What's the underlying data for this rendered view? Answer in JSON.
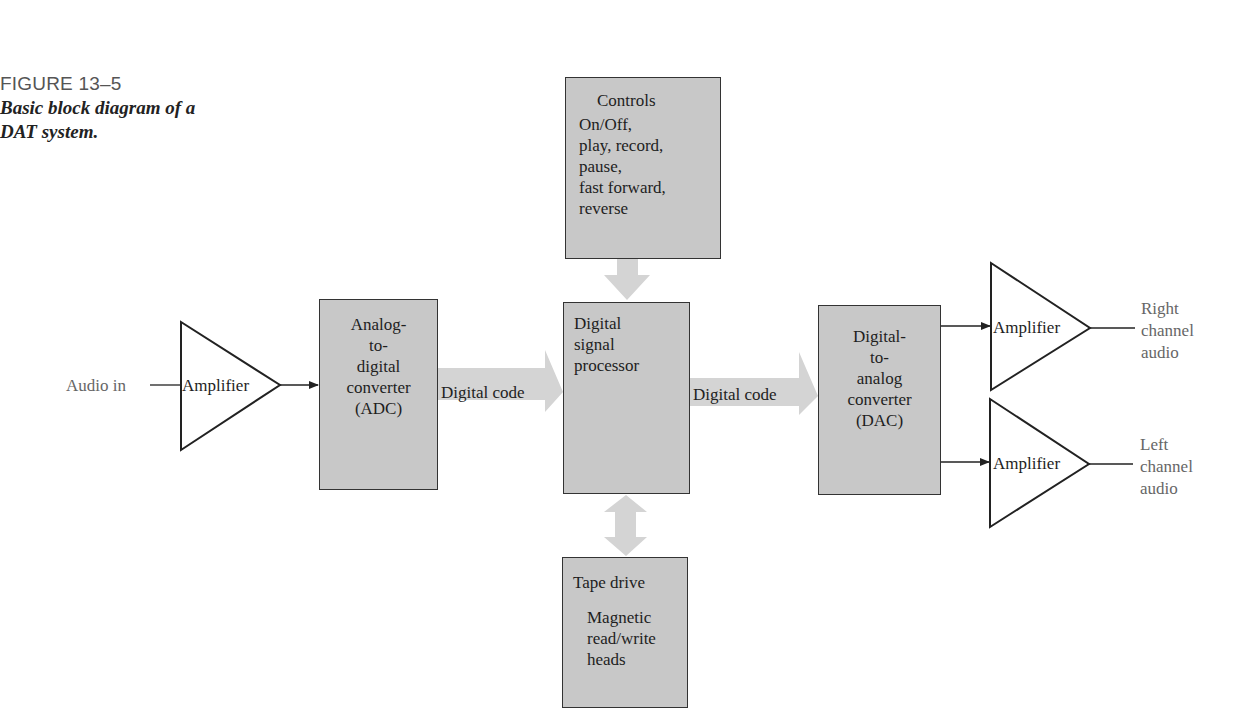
{
  "caption": {
    "figure_number": "FIGURE 13–5",
    "title_line1": "Basic block diagram of a",
    "title_line2": "DAT system."
  },
  "input": {
    "label": "Audio in"
  },
  "amplifiers": {
    "input": "Amplifier",
    "right": "Amplifier",
    "left": "Amplifier"
  },
  "blocks": {
    "controls": {
      "title": "Controls",
      "lines": [
        "On/Off,",
        "play, record,",
        "pause,",
        "fast forward,",
        "reverse"
      ]
    },
    "adc": {
      "lines": [
        "Analog-",
        "to-",
        "digital",
        "converter",
        "(ADC)"
      ]
    },
    "dsp": {
      "lines": [
        "Digital",
        "signal",
        "processor"
      ]
    },
    "dac": {
      "lines": [
        "Digital-",
        "to-",
        "analog",
        "converter",
        "(DAC)"
      ]
    },
    "tape_drive": {
      "title": "Tape drive",
      "lines": [
        "Magnetic",
        "read/write",
        "heads"
      ]
    }
  },
  "arrows": {
    "adc_to_dsp": "Digital code",
    "dsp_to_dac": "Digital code"
  },
  "outputs": {
    "right": [
      "Right",
      "channel",
      "audio"
    ],
    "left": [
      "Left",
      "channel",
      "audio"
    ]
  },
  "colors": {
    "block_fill": "#c8c8c8",
    "arrow_fill": "#d4d4d4",
    "stroke": "#222222"
  }
}
